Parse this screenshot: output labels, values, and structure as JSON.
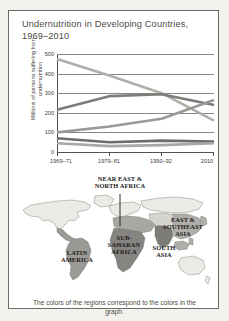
{
  "figure": {
    "title": "Undernutrition in Developing\nCountries, 1969–2010",
    "caption": "The colors of the regions correspond to the\ncolors in the graph."
  },
  "chart_data": {
    "type": "line",
    "title": "Undernutrition in Developing Countries, 1969–2010",
    "xlabel": "",
    "ylabel": "Millions of persons\nsuffering from undernutrition",
    "categories": [
      "1969–71",
      "1979–81",
      "1990–92",
      "2010"
    ],
    "ylim": [
      0,
      500
    ],
    "yticks": [
      0,
      100,
      200,
      300,
      400,
      500
    ],
    "ytick_labels": [
      "0",
      "100",
      "200",
      "300",
      "400",
      "500"
    ],
    "grid": true,
    "legend": "map",
    "series": [
      {
        "name": "EAST & SOUTHEAST ASIA",
        "color": "#b0aeaa",
        "values": [
          475,
          390,
          300,
          160
        ]
      },
      {
        "name": "SOUTH ASIA",
        "color": "#7e7c78",
        "values": [
          215,
          285,
          295,
          240
        ]
      },
      {
        "name": "SUB-SAHARAN AFRICA",
        "color": "#9b9995",
        "values": [
          100,
          130,
          170,
          265
        ]
      },
      {
        "name": "LATIN AMERICA",
        "color": "#6f6d6a",
        "values": [
          70,
          50,
          58,
          53
        ]
      },
      {
        "name": "NEAR EAST & NORTH AFRICA",
        "color": "#а9a7a3",
        "values": [
          45,
          30,
          35,
          45
        ]
      }
    ]
  },
  "map": {
    "labels": [
      {
        "id": "near-east-north-africa",
        "text": "NEAR EAST &\nNORTH AFRICA"
      },
      {
        "id": "east-southeast-asia",
        "text": "EAST &\nSOUTHEAST\nASIA"
      },
      {
        "id": "latin-america",
        "text": "LATIN\nAMERICA"
      },
      {
        "id": "sub-saharan-africa",
        "text": "SUB-\nSAHARAN\nAFRICA"
      },
      {
        "id": "south-asia",
        "text": "SOUTH\nASIA"
      }
    ]
  }
}
